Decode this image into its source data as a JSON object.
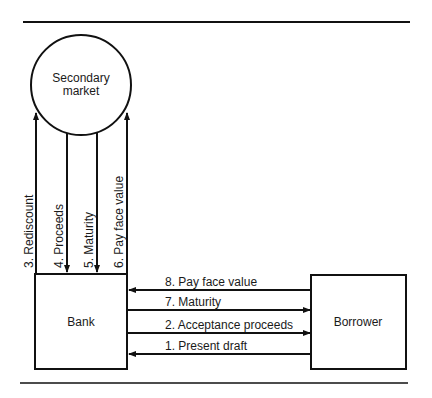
{
  "nodes": {
    "secondary_market": {
      "line1": "Secondary",
      "line2": "market"
    },
    "bank": "Bank",
    "borrower": "Borrower"
  },
  "vertical_flows": [
    {
      "label": "3.  Rediscount",
      "direction": "up"
    },
    {
      "label": "4.  Proceeds",
      "direction": "down"
    },
    {
      "label": "5.  Maturity",
      "direction": "down"
    },
    {
      "label": "6.  Pay face value",
      "direction": "up"
    }
  ],
  "horizontal_flows": [
    {
      "label": "8.  Pay face value",
      "direction": "left"
    },
    {
      "label": "7.  Maturity",
      "direction": "right"
    },
    {
      "label": "2.  Acceptance proceeds",
      "direction": "right"
    },
    {
      "label": "1.  Present draft",
      "direction": "left"
    }
  ]
}
